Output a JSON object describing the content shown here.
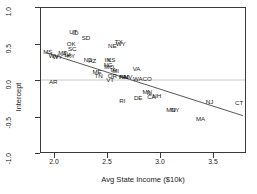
{
  "chart_data": {
    "type": "scatter",
    "title": "",
    "xlabel": "Avg State Income ($10k)",
    "ylabel": "Intercept",
    "xlim": [
      1.87,
      3.82
    ],
    "ylim": [
      -1.12,
      1.12
    ],
    "xticks": [
      "2.0",
      "2.5",
      "3.0",
      "3.5"
    ],
    "xtick_values": [
      2.0,
      2.5,
      3.0,
      3.5
    ],
    "yticks": [
      "1.0",
      "0.5",
      "0.0",
      "-0.5",
      "-1.0"
    ],
    "ytick_values": [
      1.0,
      0.5,
      0.0,
      -0.5,
      -1.0
    ],
    "grid": false,
    "legend": "none",
    "marker_style": "text-label",
    "points": [
      {
        "label": "MS",
        "x": 1.935,
        "y": 0.455
      },
      {
        "label": "WV",
        "x": 1.99,
        "y": 0.395
      },
      {
        "label": "WY",
        "x": 2.025,
        "y": 0.385
      },
      {
        "label": "MT",
        "x": 2.075,
        "y": 0.445
      },
      {
        "label": "AL",
        "x": 2.105,
        "y": 0.425
      },
      {
        "label": "LA",
        "x": 2.125,
        "y": 0.415
      },
      {
        "label": "KY",
        "x": 2.155,
        "y": 0.405
      },
      {
        "label": "SC",
        "x": 2.165,
        "y": 0.505
      },
      {
        "label": "OK",
        "x": 2.155,
        "y": 0.585
      },
      {
        "label": "UT",
        "x": 2.175,
        "y": 0.76
      },
      {
        "label": "ID",
        "x": 2.195,
        "y": 0.755
      },
      {
        "label": "SD",
        "x": 2.295,
        "y": 0.675
      },
      {
        "label": "ND",
        "x": 2.315,
        "y": 0.33
      },
      {
        "label": "AZ",
        "x": 2.355,
        "y": 0.315
      },
      {
        "label": "ME",
        "x": 2.4,
        "y": 0.155
      },
      {
        "label": "TN",
        "x": 2.415,
        "y": 0.095
      },
      {
        "label": "IN",
        "x": 2.5,
        "y": 0.345
      },
      {
        "label": "KS",
        "x": 2.535,
        "y": 0.345
      },
      {
        "label": "MO",
        "x": 2.515,
        "y": 0.225
      },
      {
        "label": "NC",
        "x": 2.505,
        "y": 0.265
      },
      {
        "label": "IA",
        "x": 2.555,
        "y": 0.185
      },
      {
        "label": "MI",
        "x": 2.575,
        "y": 0.175
      },
      {
        "label": "OR",
        "x": 2.545,
        "y": 0.095
      },
      {
        "label": "VT",
        "x": 2.525,
        "y": 0.035
      },
      {
        "label": "NE",
        "x": 2.545,
        "y": 0.545
      },
      {
        "label": "TX",
        "x": 2.605,
        "y": 0.615
      },
      {
        "label": "WY",
        "x": 2.625,
        "y": 0.585
      },
      {
        "label": "PA",
        "x": 2.645,
        "y": 0.075
      },
      {
        "label": "NM",
        "x": 2.655,
        "y": 0.075
      },
      {
        "label": "NV",
        "x": 2.695,
        "y": 0.07
      },
      {
        "label": "WA",
        "x": 2.785,
        "y": 0.045
      },
      {
        "label": "VA",
        "x": 2.775,
        "y": 0.195
      },
      {
        "label": "CO",
        "x": 2.875,
        "y": 0.05
      },
      {
        "label": "MN",
        "x": 2.875,
        "y": -0.155
      },
      {
        "label": "IL",
        "x": 2.895,
        "y": -0.165
      },
      {
        "label": "CA",
        "x": 2.915,
        "y": -0.225
      },
      {
        "label": "NH",
        "x": 2.965,
        "y": -0.215
      },
      {
        "label": "DE",
        "x": 2.79,
        "y": -0.245
      },
      {
        "label": "RI",
        "x": 2.64,
        "y": -0.285
      },
      {
        "label": "MD",
        "x": 3.1,
        "y": -0.425
      },
      {
        "label": "NY",
        "x": 3.14,
        "y": -0.425
      },
      {
        "label": "MA",
        "x": 3.38,
        "y": -0.565
      },
      {
        "label": "NJ",
        "x": 3.465,
        "y": -0.305
      },
      {
        "label": "CT",
        "x": 3.745,
        "y": -0.32
      },
      {
        "label": "AR",
        "x": 1.985,
        "y": 0.005
      }
    ],
    "reference_line": {
      "type": "horizontal",
      "y": 0.0,
      "color": "#b9b9b9"
    },
    "fit_line": {
      "type": "linear-fit",
      "x_start": 1.92,
      "y_start": 0.425,
      "x_end": 3.8,
      "y_end": -0.555,
      "color": "#555555"
    }
  }
}
